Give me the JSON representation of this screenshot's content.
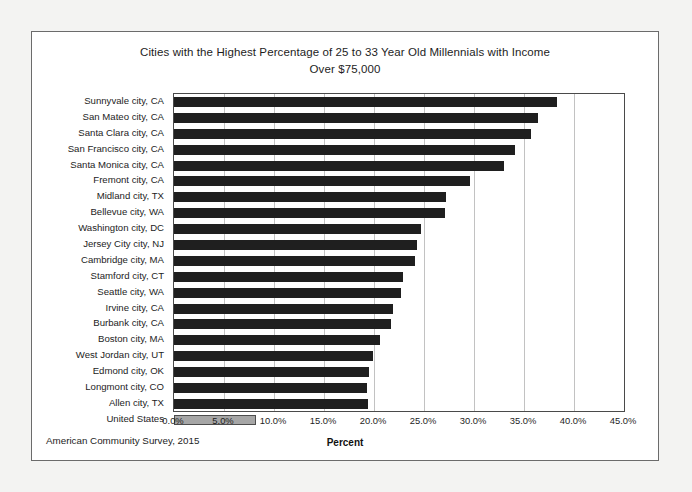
{
  "document": {
    "source_note": "American Community Survey, 2015"
  },
  "chart_data": {
    "type": "bar",
    "orientation": "horizontal",
    "title": "Cities with the Highest Percentage of 25 to 33 Year Old Millennials with Income Over $75,000",
    "title_line1": "Cities with the Highest Percentage of 25 to 33 Year Old Millennials with Income",
    "title_line2": "Over $75,000",
    "xlabel": "Percent",
    "ylabel": "",
    "xlim": [
      0,
      45
    ],
    "xticks": [
      0,
      5,
      10,
      15,
      20,
      25,
      30,
      35,
      40,
      45
    ],
    "xtick_labels": [
      "0.0%",
      "5.0%",
      "10.0%",
      "15.0%",
      "20.0%",
      "25.0%",
      "30.0%",
      "35.0%",
      "40.0%",
      "45.0%"
    ],
    "grid": "vertical",
    "legend": "none",
    "bar_color": "#1f1f1f",
    "highlight_color": "#a6a6a6",
    "categories": [
      "Sunnyvale city, CA",
      "San Mateo city, CA",
      "Santa Clara city, CA",
      "San Francisco city, CA",
      "Santa Monica city, CA",
      "Fremont city, CA",
      "Midland city, TX",
      "Bellevue city, WA",
      "Washington city, DC",
      "Jersey City city, NJ",
      "Cambridge city, MA",
      "Stamford city, CT",
      "Seattle city, WA",
      "Irvine city, CA",
      "Burbank city, CA",
      "Boston city, MA",
      "West Jordan city, UT",
      "Edmond city, OK",
      "Longmont city, CO",
      "Allen city, TX",
      "United States"
    ],
    "values": [
      38.3,
      36.4,
      35.7,
      34.1,
      33.0,
      29.6,
      27.2,
      27.1,
      24.7,
      24.3,
      24.1,
      22.9,
      22.7,
      21.9,
      21.7,
      20.6,
      19.9,
      19.5,
      19.3,
      19.4,
      8.2
    ],
    "highlight_index": 20
  }
}
